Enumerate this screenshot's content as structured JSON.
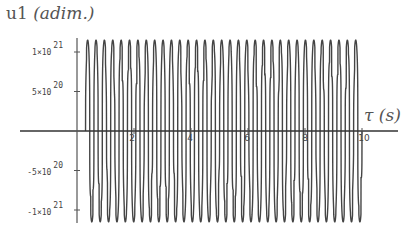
{
  "chart_data": {
    "type": "line",
    "title": "",
    "ylabel": "u1 (adim.)",
    "xlabel": "τ (s)",
    "xlim": [
      0,
      10.5
    ],
    "ylim": [
      -1.25e+21,
      1.25e+21
    ],
    "grid": false,
    "legend": null,
    "x_ticks": [
      2,
      4,
      6,
      8,
      10
    ],
    "x_tick_labels": [
      "2",
      "4",
      "6",
      "8",
      "10"
    ],
    "y_ticks": [
      1e+21,
      5e+20,
      -5e+20,
      -1e+21
    ],
    "y_tick_labels": [
      {
        "mantissa": "1×10",
        "exp": "21"
      },
      {
        "mantissa": "5×10",
        "exp": "20"
      },
      {
        "mantissa": "-5×10",
        "exp": "20"
      },
      {
        "mantissa": "-1×10",
        "exp": "21"
      }
    ],
    "series": [
      {
        "name": "u1",
        "description": "Dense oscillation starting near τ≈0.3 s, ~33 cycles up to τ=10 s, peak amplitude ≈ ±1.15×10^21 with beat-like intermediate plateaus",
        "t_start": 0.3,
        "t_end": 10,
        "cycles": 33,
        "amplitude": 1.15e+21,
        "color": "#444444"
      }
    ]
  },
  "labels": {
    "y_title_main": "u1 ",
    "y_title_unit": "(adim.)",
    "x_title": "τ (s)"
  }
}
